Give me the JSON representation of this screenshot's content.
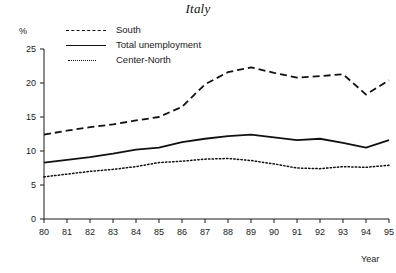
{
  "chart_data": {
    "type": "line",
    "title": "Italy",
    "xlabel": "Year",
    "ylabel": "%",
    "x": [
      80,
      81,
      82,
      83,
      84,
      85,
      86,
      87,
      88,
      89,
      90,
      91,
      92,
      93,
      94,
      95
    ],
    "xtick_labels": [
      "80",
      "81",
      "82",
      "83",
      "84",
      "85",
      "86",
      "87",
      "88",
      "89",
      "90",
      "91",
      "92",
      "93",
      "94",
      "95"
    ],
    "ytick_labels": [
      "0",
      "5",
      "10",
      "15",
      "20",
      "25"
    ],
    "yticks": [
      0,
      5,
      10,
      15,
      20,
      25
    ],
    "xlim": [
      80,
      95
    ],
    "ylim": [
      0,
      25
    ],
    "grid": false,
    "legend_position": "top-left-inside",
    "series": [
      {
        "name": "South",
        "style": "dashed",
        "color": "#111111",
        "values": [
          12.4,
          13.0,
          13.5,
          13.9,
          14.5,
          15.0,
          16.5,
          19.8,
          21.6,
          22.3,
          21.5,
          20.8,
          21.0,
          21.3,
          18.3,
          20.4
        ]
      },
      {
        "name": "Total unemployment",
        "style": "solid",
        "color": "#111111",
        "values": [
          8.3,
          8.7,
          9.1,
          9.6,
          10.2,
          10.5,
          11.3,
          11.8,
          12.2,
          12.4,
          12.0,
          11.6,
          11.8,
          11.2,
          10.5,
          11.6
        ]
      },
      {
        "name": "Center-North",
        "style": "dotted",
        "color": "#111111",
        "values": [
          6.2,
          6.6,
          7.0,
          7.3,
          7.7,
          8.3,
          8.5,
          8.8,
          8.9,
          8.6,
          8.1,
          7.5,
          7.4,
          7.7,
          7.6,
          7.9
        ]
      }
    ],
    "series_end_values": {
      "South": 22.3,
      "Total unemployment": 12.1,
      "Center-North": 7.8
    }
  },
  "axes": {
    "unit_label": "%",
    "x_axis_title": "Year"
  },
  "legend": {
    "items": [
      {
        "label": "South",
        "key": "dashed-line-key"
      },
      {
        "label": "Total unemployment",
        "key": "solid-line-key"
      },
      {
        "label": "Center-North",
        "key": "dotted-line-key"
      }
    ]
  }
}
